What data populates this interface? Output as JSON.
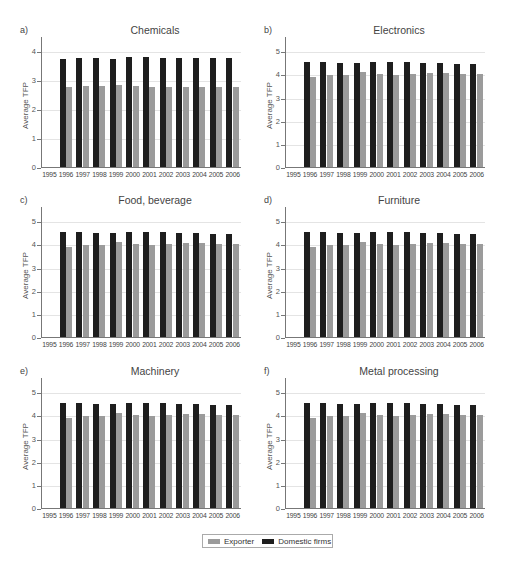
{
  "legend": {
    "items": [
      {
        "label": "Exporter",
        "color": "#9b9b9b"
      },
      {
        "label": "Domestic firms",
        "color": "#1e1e1e"
      }
    ]
  },
  "chart_data": [
    {
      "type": "bar",
      "letter": "a)",
      "title": "Chemicals",
      "xlabel": "",
      "ylabel": "Average TFP",
      "ylim": [
        0,
        4.3
      ],
      "yticks": [
        0,
        1,
        2,
        3,
        4
      ],
      "grid": true,
      "categories": [
        "1995",
        "1996",
        "1997",
        "1998",
        "1999",
        "2000",
        "2001",
        "2002",
        "2003",
        "2004",
        "2005",
        "2006"
      ],
      "series": [
        {
          "name": "Domestic firms",
          "values": [
            null,
            3.76,
            3.79,
            3.79,
            3.76,
            3.81,
            3.81,
            3.8,
            3.77,
            3.77,
            3.77,
            3.8
          ]
        },
        {
          "name": "Exporter",
          "values": [
            null,
            2.77,
            2.81,
            2.81,
            2.85,
            2.82,
            2.8,
            2.79,
            2.77,
            2.78,
            2.79,
            2.79
          ]
        }
      ]
    },
    {
      "type": "bar",
      "letter": "b)",
      "title": "Electronics",
      "xlabel": "",
      "ylabel": "Average TFP",
      "ylim": [
        0,
        5.4
      ],
      "yticks": [
        0,
        1,
        2,
        3,
        4,
        5
      ],
      "grid": true,
      "categories": [
        "1995",
        "1996",
        "1997",
        "1998",
        "1999",
        "2000",
        "2001",
        "2002",
        "2003",
        "2004",
        "2005",
        "2006"
      ],
      "series": [
        {
          "name": "Domestic firms",
          "values": [
            null,
            4.57,
            4.58,
            4.55,
            4.55,
            4.57,
            4.58,
            4.57,
            4.55,
            4.53,
            4.51,
            4.5
          ]
        },
        {
          "name": "Exporter",
          "values": [
            null,
            3.93,
            4.0,
            4.0,
            4.16,
            4.05,
            4.01,
            4.07,
            4.09,
            4.09,
            4.07,
            4.05
          ]
        }
      ]
    },
    {
      "type": "bar",
      "letter": "c)",
      "title": "Food, beverage",
      "xlabel": "",
      "ylabel": "Average TFP",
      "ylim": [
        0,
        5.4
      ],
      "yticks": [
        0,
        1,
        2,
        3,
        4,
        5
      ],
      "grid": true,
      "categories": [
        "1995",
        "1996",
        "1997",
        "1998",
        "1999",
        "2000",
        "2001",
        "2002",
        "2003",
        "2004",
        "2005",
        "2006"
      ],
      "series": [
        {
          "name": "Domestic firms",
          "values": [
            null,
            4.57,
            4.58,
            4.55,
            4.55,
            4.57,
            4.58,
            4.57,
            4.55,
            4.53,
            4.51,
            4.5
          ]
        },
        {
          "name": "Exporter",
          "values": [
            null,
            3.93,
            4.0,
            4.0,
            4.16,
            4.05,
            4.01,
            4.07,
            4.09,
            4.09,
            4.07,
            4.05
          ]
        }
      ]
    },
    {
      "type": "bar",
      "letter": "d)",
      "title": "Furniture",
      "xlabel": "",
      "ylabel": "Average TFP",
      "ylim": [
        0,
        5.4
      ],
      "yticks": [
        0,
        1,
        2,
        3,
        4,
        5
      ],
      "grid": true,
      "categories": [
        "1995",
        "1996",
        "1997",
        "1998",
        "1999",
        "2000",
        "2001",
        "2002",
        "2003",
        "2004",
        "2005",
        "2006"
      ],
      "series": [
        {
          "name": "Domestic firms",
          "values": [
            null,
            4.57,
            4.58,
            4.55,
            4.55,
            4.57,
            4.58,
            4.57,
            4.55,
            4.53,
            4.51,
            4.5
          ]
        },
        {
          "name": "Exporter",
          "values": [
            null,
            3.93,
            4.0,
            4.0,
            4.16,
            4.05,
            4.01,
            4.07,
            4.09,
            4.09,
            4.07,
            4.05
          ]
        }
      ]
    },
    {
      "type": "bar",
      "letter": "e)",
      "title": "Machinery",
      "xlabel": "",
      "ylabel": "Average TFP",
      "ylim": [
        0,
        5.4
      ],
      "yticks": [
        0,
        1,
        2,
        3,
        4,
        5
      ],
      "grid": true,
      "categories": [
        "1995",
        "1996",
        "1997",
        "1998",
        "1999",
        "2000",
        "2001",
        "2002",
        "2003",
        "2004",
        "2005",
        "2006"
      ],
      "series": [
        {
          "name": "Domestic firms",
          "values": [
            null,
            4.57,
            4.58,
            4.55,
            4.55,
            4.57,
            4.58,
            4.57,
            4.55,
            4.53,
            4.51,
            4.5
          ]
        },
        {
          "name": "Exporter",
          "values": [
            null,
            3.93,
            4.0,
            4.0,
            4.16,
            4.05,
            4.01,
            4.07,
            4.09,
            4.09,
            4.07,
            4.05
          ]
        }
      ]
    },
    {
      "type": "bar",
      "letter": "f)",
      "title": "Metal processing",
      "xlabel": "",
      "ylabel": "Average TFP",
      "ylim": [
        0,
        5.4
      ],
      "yticks": [
        0,
        1,
        2,
        3,
        4,
        5
      ],
      "grid": true,
      "categories": [
        "1995",
        "1996",
        "1997",
        "1998",
        "1999",
        "2000",
        "2001",
        "2002",
        "2003",
        "2004",
        "2005",
        "2006"
      ],
      "series": [
        {
          "name": "Domestic firms",
          "values": [
            null,
            4.57,
            4.58,
            4.55,
            4.55,
            4.57,
            4.58,
            4.57,
            4.55,
            4.53,
            4.51,
            4.5
          ]
        },
        {
          "name": "Exporter",
          "values": [
            null,
            3.93,
            4.0,
            4.0,
            4.16,
            4.05,
            4.01,
            4.07,
            4.09,
            4.09,
            4.07,
            4.05
          ]
        }
      ]
    }
  ]
}
